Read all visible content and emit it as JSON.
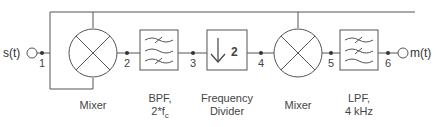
{
  "diagram": {
    "input": {
      "label": "s(t)"
    },
    "output": {
      "label": "m(t)"
    },
    "nodes": [
      "1",
      "2",
      "3",
      "4",
      "5",
      "6"
    ],
    "blocks": [
      {
        "id": "mixer1",
        "type": "mixer",
        "label_line1": "Mixer",
        "label_line2": ""
      },
      {
        "id": "bpf",
        "type": "band-pass-filter",
        "label_line1": "BPF,",
        "label_line2": "2*f",
        "label_sub": "c"
      },
      {
        "id": "divider",
        "type": "frequency-divider",
        "symbol": "2",
        "label_line1": "Frequency",
        "label_line2": "Divider"
      },
      {
        "id": "mixer2",
        "type": "mixer",
        "label_line1": "Mixer",
        "label_line2": ""
      },
      {
        "id": "lpf",
        "type": "low-pass-filter",
        "label_line1": "LPF,",
        "label_line2": "4 kHz"
      }
    ]
  }
}
